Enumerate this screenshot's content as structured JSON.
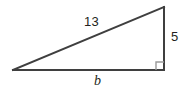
{
  "figure": {
    "kind": "right-triangle-diagram",
    "background_color": "#ffffff",
    "stroke_color": "#3f3f3f",
    "stroke_width": 2,
    "right_angle_marker_color": "#9a9a9a",
    "text_color": "#231f20",
    "vertices": {
      "left": {
        "x": 13,
        "y": 70
      },
      "top_right": {
        "x": 164,
        "y": 7
      },
      "bottom_right": {
        "x": 164,
        "y": 70
      }
    },
    "right_angle_marker": {
      "x": 156,
      "y": 62,
      "size": 8
    },
    "labels": {
      "hypotenuse": "13",
      "vertical_leg": "5",
      "base_leg": "b"
    }
  }
}
